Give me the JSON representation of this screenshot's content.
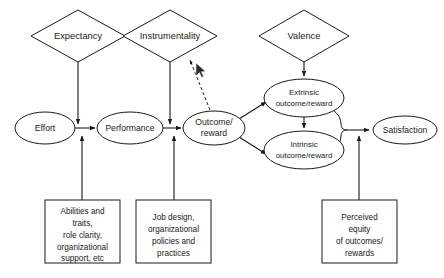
{
  "diagram": {
    "background_color": "#ffffff",
    "stroke_color": "#1a1a1a",
    "diamonds": [
      {
        "id": "expectancy",
        "label": "Expectancy",
        "cx": 78,
        "cy": 36,
        "rx": 47,
        "ry": 26
      },
      {
        "id": "instrumentality",
        "label": "Instrumentality",
        "cx": 170,
        "cy": 36,
        "rx": 47,
        "ry": 26
      },
      {
        "id": "valence",
        "label": "Valence",
        "cx": 304,
        "cy": 36,
        "rx": 45,
        "ry": 26
      }
    ],
    "ellipses": [
      {
        "id": "effort",
        "label": "Effort",
        "cx": 45,
        "cy": 128,
        "rx": 30,
        "ry": 16
      },
      {
        "id": "performance",
        "label": "Performance",
        "cx": 130,
        "cy": 128,
        "rx": 33,
        "ry": 16
      },
      {
        "id": "outcome-reward",
        "line1": "Outcome/",
        "line2": "reward",
        "cx": 214,
        "cy": 128,
        "rx": 31,
        "ry": 17
      },
      {
        "id": "extrinsic-outcome-reward",
        "line1": "Extrinsic",
        "line2": "outcome/reward",
        "cx": 304,
        "cy": 98,
        "rx": 40,
        "ry": 19
      },
      {
        "id": "intrinsic-outcome-reward",
        "line1": "Intrinsic",
        "line2": "outcome/reward",
        "cx": 304,
        "cy": 150,
        "rx": 40,
        "ry": 19
      },
      {
        "id": "satisfaction",
        "label": "Satisfaction",
        "cx": 405,
        "cy": 130,
        "rx": 32,
        "ry": 14
      }
    ],
    "boxes": [
      {
        "id": "abilities-traits-box",
        "x": 45,
        "y": 200,
        "w": 75,
        "h": 63,
        "lines": [
          "Abilities and",
          "traits,",
          "role clarity,",
          "organizational",
          "support, etc"
        ]
      },
      {
        "id": "job-design-box",
        "x": 136,
        "y": 200,
        "w": 75,
        "h": 63,
        "lines": [
          "Job design,",
          "organizational",
          "policies and",
          "practices"
        ]
      },
      {
        "id": "perceived-equity-box",
        "x": 322,
        "y": 200,
        "w": 75,
        "h": 63,
        "lines": [
          "Perceived",
          "equity",
          "of outcomes/",
          "rewards"
        ]
      }
    ],
    "connectors": [
      {
        "id": "effort-to-performance",
        "style": "solid"
      },
      {
        "id": "performance-to-outcome",
        "style": "solid"
      },
      {
        "id": "expectancy-down-to-effort-performance-link",
        "style": "solid"
      },
      {
        "id": "instrumentality-down-to-performance-outcome-link",
        "style": "solid"
      },
      {
        "id": "outcome-to-instrumentality-feedback",
        "style": "dashed"
      },
      {
        "id": "valence-down-to-extrinsic",
        "style": "solid"
      },
      {
        "id": "outcome-to-extrinsic",
        "style": "solid"
      },
      {
        "id": "outcome-to-intrinsic",
        "style": "solid"
      },
      {
        "id": "extrinsic-to-intrinsic",
        "style": "solid"
      },
      {
        "id": "outcomes-brace-to-satisfaction",
        "style": "solid"
      },
      {
        "id": "abilities-box-to-effort",
        "style": "solid"
      },
      {
        "id": "job-design-box-to-performance",
        "style": "solid"
      },
      {
        "id": "perceived-equity-box-to-satisfaction",
        "style": "solid"
      }
    ],
    "cursor": {
      "id": "mouse-cursor",
      "x": 196,
      "y": 63
    }
  }
}
